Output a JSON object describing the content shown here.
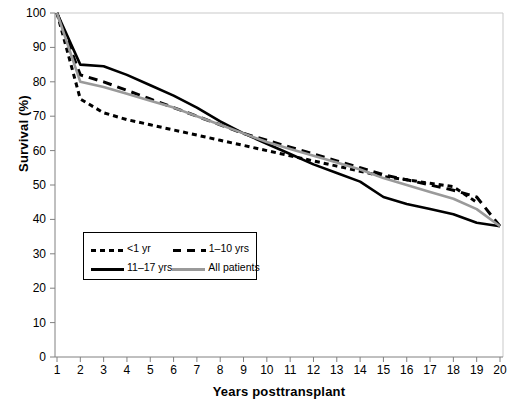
{
  "chart_data": {
    "type": "line",
    "title": "",
    "xlabel": "Years posttransplant",
    "ylabel": "Survival (%)",
    "xlim": [
      1,
      20
    ],
    "ylim": [
      0,
      100
    ],
    "xticks": [
      1,
      2,
      3,
      4,
      5,
      6,
      7,
      8,
      9,
      10,
      11,
      12,
      13,
      14,
      15,
      16,
      17,
      18,
      19,
      20
    ],
    "yticks": [
      0,
      10,
      20,
      30,
      40,
      50,
      60,
      70,
      80,
      90,
      100
    ],
    "grid": false,
    "legend_position": "lower-left-inside",
    "x": [
      1,
      2,
      3,
      4,
      5,
      6,
      7,
      8,
      9,
      10,
      11,
      12,
      13,
      14,
      15,
      16,
      17,
      18,
      19,
      20
    ],
    "series": [
      {
        "name": "<1 yr",
        "style": "dotted",
        "color": "#000000",
        "values": [
          100,
          75,
          71,
          69,
          67.5,
          66,
          64.5,
          63,
          61.5,
          60,
          58.5,
          57,
          55.5,
          54,
          52.5,
          51.5,
          50.5,
          49.5,
          45,
          null
        ]
      },
      {
        "name": "1–10 yrs",
        "style": "dashed",
        "color": "#000000",
        "values": [
          100,
          82,
          80,
          77.5,
          75,
          72.5,
          70,
          67.5,
          65,
          63,
          61,
          59,
          57,
          55,
          53,
          51.5,
          50,
          48.5,
          46.5,
          38
        ]
      },
      {
        "name": "11–17 yrs",
        "style": "solid",
        "color": "#000000",
        "values": [
          100,
          85,
          84.5,
          82,
          79,
          76,
          72.5,
          68.5,
          65,
          62,
          59,
          56,
          53.5,
          51,
          46.5,
          44.5,
          43,
          41.5,
          39,
          38
        ]
      },
      {
        "name": "All patients",
        "style": "solid",
        "color": "#9a9a9a",
        "values": [
          100,
          80,
          78.5,
          76.5,
          74.5,
          72.5,
          70,
          67.5,
          65,
          62.5,
          60.5,
          58.5,
          56.5,
          54.5,
          52,
          50,
          48,
          46,
          43,
          38
        ]
      }
    ]
  },
  "legend": {
    "entries": [
      {
        "label": "<1 yr",
        "key": "dotted-line-key"
      },
      {
        "label": "1–10 yrs",
        "key": "dashed-line-key"
      },
      {
        "label": "11–17 yrs",
        "key": "solid-black-line-key"
      },
      {
        "label": "All patients",
        "key": "solid-gray-line-key"
      }
    ]
  },
  "axes": {
    "y_title": "Survival (%)",
    "x_title": "Years posttransplant",
    "y_labels": [
      "100",
      "90",
      "80",
      "70",
      "60",
      "50",
      "40",
      "30",
      "20",
      "10",
      "0"
    ],
    "x_labels": [
      "1",
      "2",
      "3",
      "4",
      "5",
      "6",
      "7",
      "8",
      "9",
      "10",
      "11",
      "12",
      "13",
      "14",
      "15",
      "16",
      "17",
      "18",
      "19",
      "20"
    ]
  },
  "colors": {
    "axis": "#8a8a8a",
    "series_black": "#000000",
    "series_gray": "#9a9a9a",
    "background": "#ffffff"
  }
}
